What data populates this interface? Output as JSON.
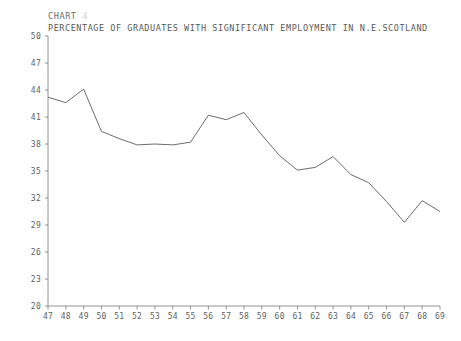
{
  "header": {
    "chart_label": "CHART",
    "chart_number": "4",
    "title": "PERCENTAGE OF GRADUATES WITH SIGNIFICANT EMPLOYMENT IN N.E.SCOTLAND"
  },
  "chart_data": {
    "type": "line",
    "title": "PERCENTAGE OF GRADUATES WITH SIGNIFICANT EMPLOYMENT IN N.E.SCOTLAND",
    "xlabel": "",
    "ylabel": "",
    "grid": false,
    "legend": "none",
    "ylim": [
      20,
      50
    ],
    "ytick_labels": [
      "50",
      "47",
      "44",
      "41",
      "38",
      "35",
      "32",
      "29",
      "26",
      "23",
      "20"
    ],
    "ytick_values": [
      50,
      47,
      44,
      41,
      38,
      35,
      32,
      29,
      26,
      23,
      20
    ],
    "xlim": [
      47,
      69
    ],
    "categories": [
      "47",
      "48",
      "49",
      "50",
      "51",
      "52",
      "53",
      "54",
      "55",
      "56",
      "57",
      "58",
      "59",
      "60",
      "61",
      "62",
      "63",
      "64",
      "65",
      "66",
      "67",
      "68",
      "69"
    ],
    "series": [
      {
        "name": "percentage",
        "values": [
          43.2,
          42.6,
          44.1,
          39.4,
          38.6,
          37.9,
          38.0,
          37.9,
          38.2,
          41.2,
          40.7,
          41.5,
          39.0,
          36.7,
          35.1,
          35.4,
          36.6,
          34.6,
          33.7,
          31.6,
          29.3,
          31.7,
          30.5
        ]
      }
    ]
  },
  "colors": {
    "line": "#5a5a5a",
    "axis": "#7a7a7a",
    "text": "#5f5f5f",
    "background": "#ffffff"
  }
}
